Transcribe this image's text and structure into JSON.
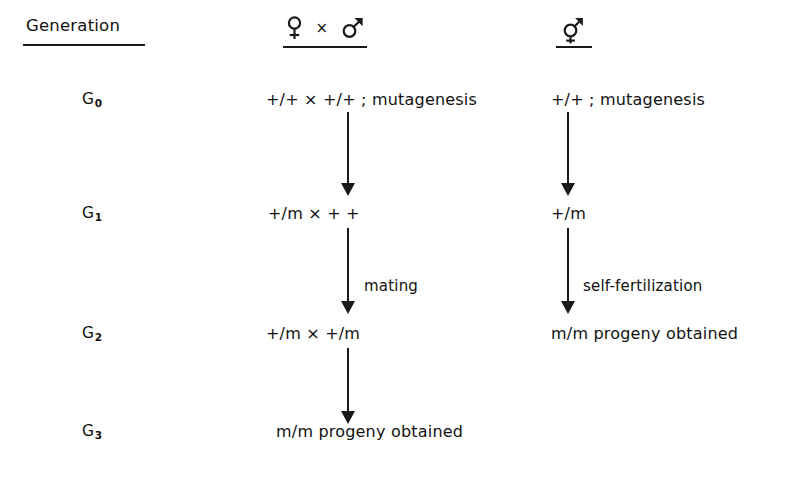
{
  "figure": {
    "background_color": "#ffffff",
    "ink_color": "#1a1a1a"
  },
  "columns": {
    "generation_header": "Generation",
    "cross_header": {
      "female_symbol": "female-symbol",
      "cross_operator": "×",
      "male_symbol": "male-symbol"
    },
    "self_header": {
      "hermaphrodite_symbol": "hermaphrodite-symbol"
    }
  },
  "rows": [
    {
      "generation": "G",
      "subscript": "0",
      "cross_text": "+/+ ×  +/+ ; mutagenesis",
      "self_text": "+/+ ; mutagenesis"
    },
    {
      "generation": "G",
      "subscript": "1",
      "cross_text": "+/m × + +",
      "self_text": "+/m"
    },
    {
      "generation": "G",
      "subscript": "2",
      "cross_text": "+/m  ×  +/m",
      "self_text": "m/m  progeny obtained"
    },
    {
      "generation": "G",
      "subscript": "3",
      "cross_text": "m/m  progeny obtained",
      "self_text": ""
    }
  ],
  "arrows": {
    "cross_g0_g1_label": "",
    "cross_g1_g2_label": "mating",
    "cross_g2_g3_label": "",
    "self_g0_g1_label": "",
    "self_g1_g2_label": "self-fertilization"
  }
}
